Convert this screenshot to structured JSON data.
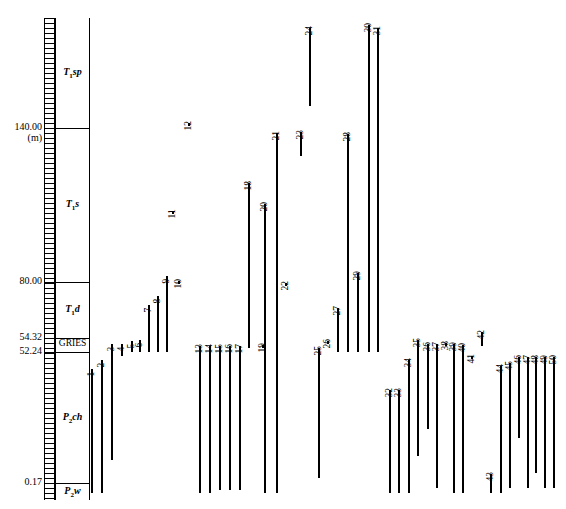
{
  "chart_data": {
    "type": "range-chart",
    "ylabel": "Depth (m)",
    "ylim": [
      0.17,
      186.0
    ],
    "grid": false,
    "legend": null,
    "axis": {
      "unit_label": "(m)",
      "ticks": [
        {
          "value": "140.00",
          "y_px": 128
        },
        {
          "value": "80.00",
          "y_px": 282
        },
        {
          "value": "54.32",
          "y_px": 338
        },
        {
          "value": "52.24",
          "y_px": 352
        },
        {
          "value": "0.17",
          "y_px": 483
        }
      ]
    },
    "formations": [
      {
        "label": "T",
        "sub": "1",
        "suffix": "sp",
        "top_px": 18,
        "bottom_px": 128
      },
      {
        "label": "T",
        "sub": "1",
        "suffix": "s",
        "top_px": 128,
        "bottom_px": 282
      },
      {
        "label": "T",
        "sub": "1",
        "suffix": "d",
        "top_px": 282,
        "bottom_px": 338
      },
      {
        "label": "GRIES",
        "sub": "",
        "suffix": "",
        "top_px": 338,
        "bottom_px": 352
      },
      {
        "label": "P",
        "sub": "2",
        "suffix": "ch",
        "top_px": 352,
        "bottom_px": 483
      },
      {
        "label": "P",
        "sub": "2",
        "suffix": "w",
        "top_px": 483,
        "bottom_px": 500
      }
    ],
    "taxa": [
      {
        "id": 1,
        "x": 91,
        "top": 369,
        "bottom": 493
      },
      {
        "id": 2,
        "x": 101,
        "top": 360,
        "bottom": 493
      },
      {
        "id": 3,
        "x": 111,
        "top": 344,
        "bottom": 460
      },
      {
        "id": 4,
        "x": 121,
        "top": 344,
        "bottom": 356
      },
      {
        "id": 5,
        "x": 131,
        "top": 341,
        "bottom": 352
      },
      {
        "id": 6,
        "x": 139,
        "top": 340,
        "bottom": 352
      },
      {
        "id": 7,
        "x": 148,
        "top": 305,
        "bottom": 352
      },
      {
        "id": 8,
        "x": 157,
        "top": 296,
        "bottom": 352
      },
      {
        "id": 9,
        "x": 166,
        "top": 276,
        "bottom": 352
      },
      {
        "id": 10,
        "x": 178,
        "top": 281,
        "bottom": 284
      },
      {
        "id": 11,
        "x": 172,
        "top": 211,
        "bottom": 214
      },
      {
        "id": 12,
        "x": 188,
        "top": 123,
        "bottom": 126
      },
      {
        "id": 13,
        "x": 199,
        "top": 346,
        "bottom": 493
      },
      {
        "id": 14,
        "x": 209,
        "top": 346,
        "bottom": 493
      },
      {
        "id": 15,
        "x": 219,
        "top": 346,
        "bottom": 490
      },
      {
        "id": 16,
        "x": 229,
        "top": 346,
        "bottom": 490
      },
      {
        "id": 17,
        "x": 239,
        "top": 346,
        "bottom": 490
      },
      {
        "id": 18,
        "x": 248,
        "top": 183,
        "bottom": 348
      },
      {
        "id": 19,
        "x": 262,
        "top": 345,
        "bottom": 348
      },
      {
        "id": 20,
        "x": 264,
        "top": 204,
        "bottom": 493
      },
      {
        "id": 21,
        "x": 276,
        "top": 133,
        "bottom": 493
      },
      {
        "id": 22,
        "x": 285,
        "top": 283,
        "bottom": 286
      },
      {
        "id": 23,
        "x": 300,
        "top": 132,
        "bottom": 156
      },
      {
        "id": 24,
        "x": 309,
        "top": 28,
        "bottom": 106
      },
      {
        "id": 25,
        "x": 318,
        "top": 348,
        "bottom": 478
      },
      {
        "id": 26,
        "x": 327,
        "top": 341,
        "bottom": 344
      },
      {
        "id": 27,
        "x": 337,
        "top": 308,
        "bottom": 352
      },
      {
        "id": 28,
        "x": 347,
        "top": 134,
        "bottom": 352
      },
      {
        "id": 29,
        "x": 357,
        "top": 273,
        "bottom": 352
      },
      {
        "id": 30,
        "x": 368,
        "top": 25,
        "bottom": 352
      },
      {
        "id": 31,
        "x": 377,
        "top": 28,
        "bottom": 352
      },
      {
        "id": 32,
        "x": 389,
        "top": 390,
        "bottom": 493
      },
      {
        "id": 33,
        "x": 398,
        "top": 390,
        "bottom": 493
      },
      {
        "id": 34,
        "x": 408,
        "top": 360,
        "bottom": 493
      },
      {
        "id": 35,
        "x": 417,
        "top": 340,
        "bottom": 456
      },
      {
        "id": 36,
        "x": 427,
        "top": 344,
        "bottom": 429
      },
      {
        "id": 37,
        "x": 436,
        "top": 344,
        "bottom": 488
      },
      {
        "id": 38,
        "x": 445,
        "top": 343,
        "bottom": 346
      },
      {
        "id": 39,
        "x": 453,
        "top": 344,
        "bottom": 493
      },
      {
        "id": 40,
        "x": 462,
        "top": 345,
        "bottom": 493
      },
      {
        "id": 41,
        "x": 471,
        "top": 356,
        "bottom": 359
      },
      {
        "id": 42,
        "x": 481,
        "top": 332,
        "bottom": 346
      },
      {
        "id": 43,
        "x": 490,
        "top": 474,
        "bottom": 493
      },
      {
        "id": 44,
        "x": 500,
        "top": 366,
        "bottom": 493
      },
      {
        "id": 45,
        "x": 509,
        "top": 363,
        "bottom": 488
      },
      {
        "id": 46,
        "x": 518,
        "top": 357,
        "bottom": 438
      },
      {
        "id": 47,
        "x": 527,
        "top": 357,
        "bottom": 488
      },
      {
        "id": 48,
        "x": 535,
        "top": 357,
        "bottom": 473
      },
      {
        "id": 49,
        "x": 544,
        "top": 357,
        "bottom": 488
      },
      {
        "id": 50,
        "x": 553,
        "top": 357,
        "bottom": 488
      }
    ]
  }
}
